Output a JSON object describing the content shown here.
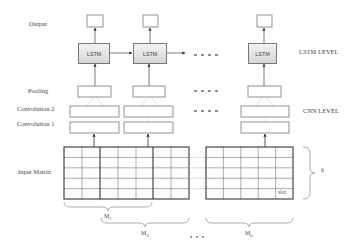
{
  "diagram": {
    "type": "CNN-LSTM architecture diagram",
    "row_labels": {
      "output": "Output",
      "pooling": "Pooling",
      "convolution2": "Convolution 2",
      "convolution1": "Convolution 1",
      "input_matrix": "Input Matrix"
    },
    "level_labels": {
      "lstm_level": "LSTM LEVEL",
      "cnn_level": "CNN LEVEL"
    },
    "lstm_label": "LSTM",
    "columns": [
      {
        "id": "col1",
        "lstm": "LSTM"
      },
      {
        "id": "col2",
        "lstm": "LSTM"
      },
      {
        "id": "colN",
        "lstm": "LSTM"
      }
    ],
    "ellipsis": "- - - -",
    "matrix": {
      "slot_label": "slot",
      "height_label": "h",
      "segments": [
        {
          "label": "M1",
          "main": "M",
          "sub": "1"
        },
        {
          "label": "M2",
          "main": "M",
          "sub": "2"
        },
        {
          "label": "Mn",
          "main": "M",
          "sub": "n"
        }
      ],
      "dots": "- - -"
    }
  }
}
